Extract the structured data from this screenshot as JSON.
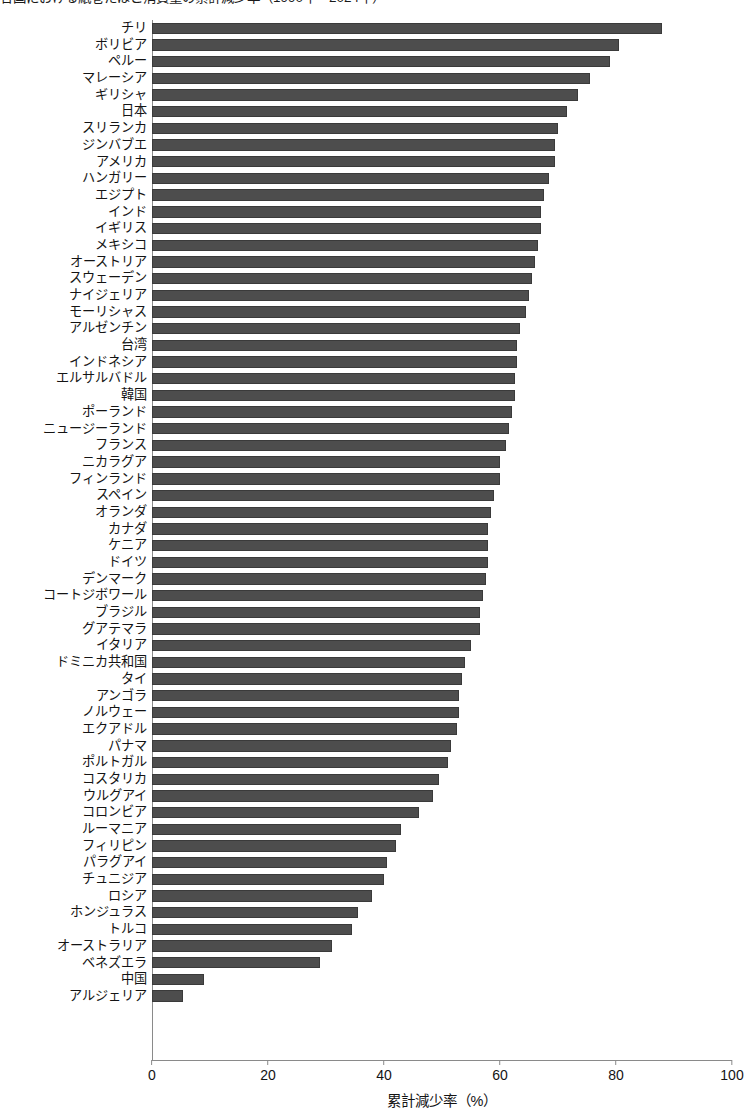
{
  "chart_data": {
    "type": "bar",
    "orientation": "horizontal",
    "title": "各国における紙巻たばこ消費量の累計減少率（1990年〜2024年）",
    "title_truncated": true,
    "xlabel": "累計減少率（%）",
    "ylabel": "",
    "xlim": [
      0,
      100
    ],
    "xticks": [
      0,
      20,
      40,
      60,
      80,
      100
    ],
    "xtick_labels": [
      "0",
      "20",
      "40",
      "60",
      "80",
      "100"
    ],
    "grid": false,
    "legend": null,
    "bar_color": "#4d4d4d",
    "categories": [
      "チリ",
      "ボリビア",
      "ペルー",
      "マレーシア",
      "ギリシャ",
      "日本",
      "スリランカ",
      "ジンバブエ",
      "アメリカ",
      "ハンガリー",
      "エジプト",
      "インド",
      "イギリス",
      "メキシコ",
      "オーストリア",
      "スウェーデン",
      "ナイジェリア",
      "モーリシャス",
      "アルゼンチン",
      "台湾",
      "インドネシア",
      "エルサルバドル",
      "韓国",
      "ポーランド",
      "ニュージーランド",
      "フランス",
      "ニカラグア",
      "フィンランド",
      "スペイン",
      "オランダ",
      "カナダ",
      "ケニア",
      "ドイツ",
      "デンマーク",
      "コートジボワール",
      "ブラジル",
      "グアテマラ",
      "イタリア",
      "ドミニカ共和国",
      "タイ",
      "アンゴラ",
      "ノルウェー",
      "エクアドル",
      "パナマ",
      "ポルトガル",
      "コスタリカ",
      "ウルグアイ",
      "コロンビア",
      "ルーマニア",
      "フィリピン",
      "パラグアイ",
      "チュニジア",
      "ロシア",
      "ホンジュラス",
      "トルコ",
      "オーストラリア",
      "ベネズエラ",
      "中国",
      "アルジェリア"
    ],
    "values": [
      88.0,
      80.5,
      79.0,
      75.5,
      73.5,
      71.5,
      70.0,
      69.5,
      69.5,
      68.5,
      67.5,
      67.0,
      67.0,
      66.5,
      66.0,
      65.5,
      65.0,
      64.5,
      63.5,
      63.0,
      63.0,
      62.5,
      62.5,
      62.0,
      61.5,
      61.0,
      60.0,
      60.0,
      59.0,
      58.5,
      58.0,
      58.0,
      58.0,
      57.5,
      57.0,
      56.5,
      56.5,
      55.0,
      54.0,
      53.5,
      53.0,
      53.0,
      52.5,
      51.5,
      51.0,
      49.5,
      48.5,
      46.0,
      43.0,
      42.0,
      40.5,
      40.0,
      38.0,
      35.5,
      34.5,
      31.0,
      29.0,
      9.0,
      5.3
    ]
  }
}
